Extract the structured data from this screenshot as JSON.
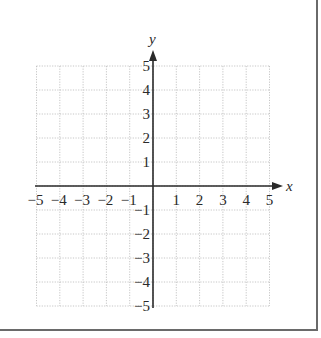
{
  "chart_data": {
    "type": "scatter",
    "title": "",
    "xlabel": "x",
    "ylabel": "y",
    "xlim": [
      -5,
      5
    ],
    "ylim": [
      -5,
      5
    ],
    "grid": true,
    "grid_style": "dotted",
    "x_ticks": [
      "−5",
      "−4",
      "−3",
      "−2",
      "−1",
      "1",
      "2",
      "3",
      "4",
      "5"
    ],
    "y_ticks": [
      "5",
      "4",
      "3",
      "2",
      "1",
      "−1",
      "−2",
      "−3",
      "−4",
      "−5"
    ],
    "series": [],
    "legend": null
  },
  "colors": {
    "grid": "#b8b8b8",
    "axis": "#2a2a2a",
    "border": "#6a6a6a"
  }
}
